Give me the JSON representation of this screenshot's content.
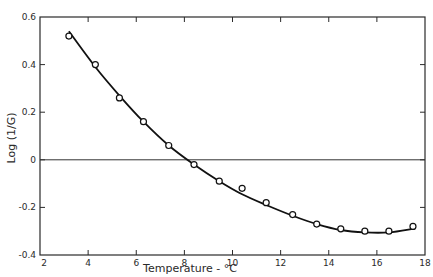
{
  "chart_data": {
    "type": "scatter",
    "title": "",
    "xlabel": "Temperature - °C",
    "ylabel": "Log (1/G)",
    "xlim": [
      2,
      18
    ],
    "ylim": [
      -0.4,
      0.6
    ],
    "x_ticks": [
      2,
      4,
      6,
      8,
      10,
      12,
      14,
      16,
      18
    ],
    "x_tick_labels": [
      "2",
      "4",
      "6",
      "8",
      "10",
      "12",
      "14",
      "16",
      "18"
    ],
    "y_ticks": [
      -0.4,
      -0.2,
      0,
      0.2,
      0.4,
      0.6
    ],
    "y_tick_labels": [
      "-0.4",
      "-0.2",
      "0",
      "0.2",
      "0.4",
      "0.6"
    ],
    "grid": false,
    "reference_line": {
      "y": 0
    },
    "series": [
      {
        "name": "observed",
        "marker": "open-circle",
        "x": [
          3.2,
          4.3,
          5.3,
          6.3,
          7.35,
          8.4,
          9.45,
          10.4,
          11.4,
          12.5,
          13.5,
          14.5,
          15.5,
          16.5,
          17.5
        ],
        "y": [
          0.52,
          0.4,
          0.26,
          0.16,
          0.06,
          -0.02,
          -0.09,
          -0.12,
          -0.18,
          -0.23,
          -0.27,
          -0.29,
          -0.3,
          -0.3,
          -0.28
        ]
      },
      {
        "name": "fitted curve",
        "marker": "line",
        "x": [
          3.2,
          4.3,
          5.3,
          6.3,
          7.35,
          8.4,
          9.45,
          10.4,
          11.4,
          12.5,
          13.5,
          14.5,
          15.5,
          16.5,
          17.5
        ],
        "y": [
          0.54,
          0.39,
          0.27,
          0.16,
          0.06,
          -0.02,
          -0.09,
          -0.145,
          -0.19,
          -0.235,
          -0.27,
          -0.295,
          -0.305,
          -0.305,
          -0.29
        ]
      }
    ]
  }
}
